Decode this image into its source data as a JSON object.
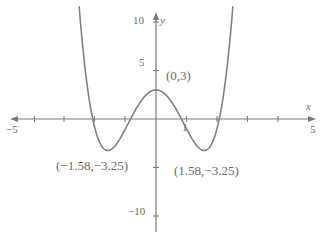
{
  "chart_data": {
    "type": "line",
    "title": "",
    "xlabel": "x",
    "ylabel": "y",
    "xlim": [
      -5,
      5
    ],
    "ylim": [
      -10,
      10
    ],
    "grid": false,
    "legend": null,
    "curve_color": "#808080",
    "axis_color": "#7a7a7a",
    "text_color": "#6b6b6b",
    "function": "y = x^4 - 5x^2 + 3",
    "x_ticks": [
      -5,
      -4,
      -3,
      -2,
      -1,
      1,
      2,
      3,
      4,
      5
    ],
    "y_ticks": [
      -10,
      -5,
      5,
      10
    ],
    "x_tick_labels": {
      "neg5": "−5",
      "one": "1",
      "pos5": "5"
    },
    "y_tick_labels": {
      "ten": "10",
      "five": "5",
      "neg_ten": "−10"
    },
    "axis_labels": {
      "x": "x",
      "y": "y"
    },
    "annotations": [
      {
        "name": "local-maximum",
        "text": "(0,3)",
        "x": 0,
        "y": 3
      },
      {
        "name": "left-minimum",
        "text": "(−1.58,−3.25)",
        "x": -1.58,
        "y": -3.25
      },
      {
        "name": "right-minimum",
        "text": "(1.58,−3.25)",
        "x": 1.58,
        "y": -3.25
      }
    ],
    "points": [
      {
        "x": 0,
        "y": 3
      },
      {
        "x": -1.58,
        "y": -3.25
      },
      {
        "x": 1.58,
        "y": -3.25
      }
    ],
    "x_intercepts": [
      -2.1,
      -0.85,
      0.85,
      2.1
    ]
  }
}
